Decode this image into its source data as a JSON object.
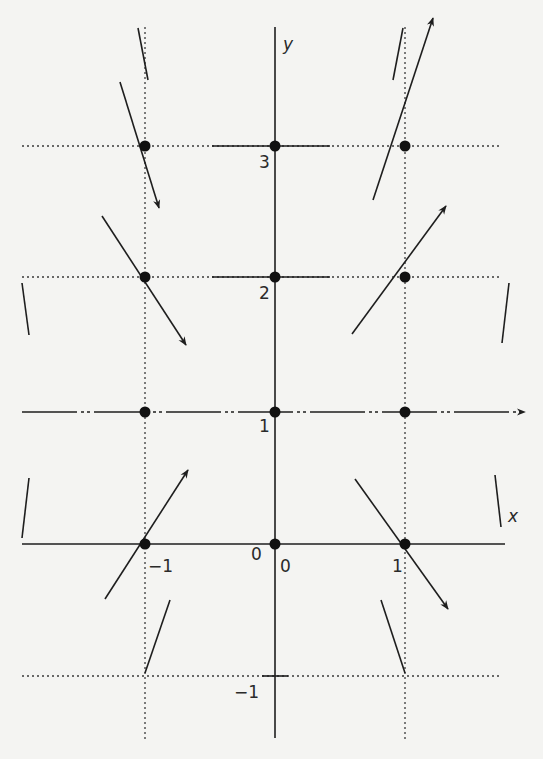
{
  "diagram": {
    "type": "direction-field",
    "colors": {
      "ink": "#1e1e1e",
      "background": "#f4f4f2",
      "grid": "#3a3a3a"
    },
    "axes": {
      "x_label": "x",
      "y_label": "y",
      "x_label_pos": [
        508,
        522
      ],
      "y_label_pos": [
        283,
        50
      ],
      "y_axis": {
        "x": 275,
        "y1": 27,
        "y2": 738
      },
      "x_axis": {
        "y": 544,
        "x1": 22,
        "x2": 505
      }
    },
    "grid": {
      "vertical_dotted": [
        {
          "x": 145,
          "y1": 27,
          "y2": 740
        },
        {
          "x": 405,
          "y1": 27,
          "y2": 740
        }
      ],
      "horizontal_dotted": [
        {
          "y": 146,
          "x1": 22,
          "x2": 502
        },
        {
          "y": 277,
          "x1": 22,
          "x2": 502
        },
        {
          "y": 676,
          "x1": 22,
          "x2": 502
        }
      ],
      "solid_ticks": [
        {
          "y": 146,
          "x1": 212,
          "x2": 330
        },
        {
          "y": 277,
          "x1": 212,
          "x2": 330
        },
        {
          "y": 676,
          "x1": 262,
          "x2": 288
        }
      ]
    },
    "equilibrium_line": {
      "y": 412,
      "x1": 22,
      "x2": 525,
      "style": "dash-dot-dot",
      "arrow": true
    },
    "tick_labels": [
      {
        "text": "3",
        "x": 259,
        "y": 168
      },
      {
        "text": "2",
        "x": 259,
        "y": 299
      },
      {
        "text": "1",
        "x": 259,
        "y": 432
      },
      {
        "text": "0",
        "x": 251,
        "y": 560
      },
      {
        "text": "0",
        "x": 280,
        "y": 572
      },
      {
        "text": "−1",
        "x": 148,
        "y": 572
      },
      {
        "text": "1",
        "x": 392,
        "y": 572
      },
      {
        "text": "−1",
        "x": 234,
        "y": 698
      }
    ],
    "points": [
      {
        "x": -1,
        "y": 3,
        "px": 145,
        "py": 146
      },
      {
        "x": 0,
        "y": 3,
        "px": 275,
        "py": 146
      },
      {
        "x": 1,
        "y": 3,
        "px": 405,
        "py": 146
      },
      {
        "x": -1,
        "y": 2,
        "px": 145,
        "py": 277
      },
      {
        "x": 0,
        "y": 2,
        "px": 275,
        "py": 277
      },
      {
        "x": 1,
        "y": 2,
        "px": 405,
        "py": 277
      },
      {
        "x": -1,
        "y": 1,
        "px": 145,
        "py": 412
      },
      {
        "x": 0,
        "y": 1,
        "px": 275,
        "py": 412
      },
      {
        "x": 1,
        "y": 1,
        "px": 405,
        "py": 412
      },
      {
        "x": -1,
        "y": 0,
        "px": 145,
        "py": 544
      },
      {
        "x": 0,
        "y": 0,
        "px": 275,
        "py": 544
      },
      {
        "x": 1,
        "y": 0,
        "px": 405,
        "py": 544
      }
    ],
    "arrows": [
      {
        "at": [
          -1,
          3
        ],
        "x1": 120,
        "y1": 82,
        "x2": 159,
        "y2": 208,
        "head": true
      },
      {
        "at": [
          1,
          3
        ],
        "x1": 373,
        "y1": 200,
        "x2": 433,
        "y2": 18,
        "head": true
      },
      {
        "at": [
          -1,
          2
        ],
        "x1": 102,
        "y1": 216,
        "x2": 186,
        "y2": 345,
        "head": true
      },
      {
        "at": [
          1,
          2
        ],
        "x1": 352,
        "y1": 334,
        "x2": 446,
        "y2": 206,
        "head": true
      },
      {
        "at": [
          -1,
          0
        ],
        "x1": 105,
        "y1": 599,
        "x2": 188,
        "y2": 470,
        "head": true
      },
      {
        "at": [
          1,
          0
        ],
        "x1": 355,
        "y1": 479,
        "x2": 448,
        "y2": 609,
        "head": true
      }
    ],
    "segments": [
      {
        "x1": 138,
        "y1": 28,
        "x2": 148,
        "y2": 80
      },
      {
        "x1": 403,
        "y1": 28,
        "x2": 393,
        "y2": 80
      },
      {
        "x1": 22,
        "y1": 283,
        "x2": 29,
        "y2": 335
      },
      {
        "x1": 509,
        "y1": 283,
        "x2": 502,
        "y2": 343
      },
      {
        "x1": 29,
        "y1": 478,
        "x2": 22,
        "y2": 538
      },
      {
        "x1": 495,
        "y1": 475,
        "x2": 501,
        "y2": 527
      },
      {
        "x1": 170,
        "y1": 600,
        "x2": 145,
        "y2": 673
      },
      {
        "x1": 381,
        "y1": 600,
        "x2": 405,
        "y2": 673
      }
    ]
  }
}
